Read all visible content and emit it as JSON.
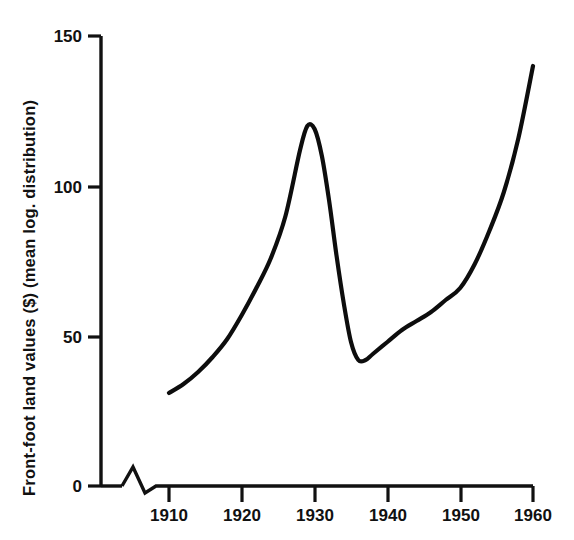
{
  "chart_data": {
    "type": "line",
    "title": "",
    "xlabel": "",
    "ylabel": "Front-foot land values ($) (mean log. distribution)",
    "xlim": [
      1910,
      1960
    ],
    "ylim": [
      0,
      150
    ],
    "grid": false,
    "legend": "none",
    "x_ticks": [
      "1910",
      "1920",
      "1930",
      "1940",
      "1950",
      "1960"
    ],
    "x_tick_values": [
      1910,
      1920,
      1930,
      1940,
      1950,
      1960
    ],
    "y_ticks": [
      "0",
      "50",
      "100",
      "150"
    ],
    "y_tick_values": [
      0,
      50,
      100,
      150
    ],
    "axis_break": true,
    "axis_break_note": "zigzag break on x-axis between origin and 1910",
    "line_color": "#0d0d0d",
    "series": [
      {
        "name": "Front-foot land values",
        "x": [
          1910,
          1912,
          1914,
          1916,
          1918,
          1920,
          1922,
          1924,
          1926,
          1928,
          1929,
          1930,
          1931,
          1932,
          1933,
          1934,
          1935,
          1936,
          1937,
          1938,
          1940,
          1942,
          1944,
          1946,
          1948,
          1950,
          1952,
          1954,
          1956,
          1958,
          1960
        ],
        "values": [
          31,
          34,
          38,
          43,
          49,
          57,
          66,
          76,
          90,
          112,
          120,
          119,
          110,
          95,
          77,
          61,
          48,
          42,
          42,
          44,
          48,
          52,
          55,
          58,
          62,
          66,
          74,
          85,
          98,
          116,
          140
        ]
      }
    ],
    "annotations": [
      {
        "label": "peak",
        "x": 1929,
        "y": 120
      },
      {
        "label": "trough",
        "x": 1936,
        "y": 42
      },
      {
        "label": "start",
        "x": 1910,
        "y": 31
      },
      {
        "label": "end",
        "x": 1960,
        "y": 140
      }
    ]
  },
  "caption": {
    "text": ""
  }
}
